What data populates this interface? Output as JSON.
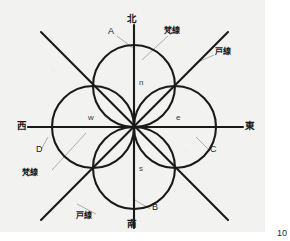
{
  "figure": {
    "background_color": "#f2f2f1",
    "stroke_color": "#1a1a1a",
    "leader_color": "#9a9a9a",
    "center": {
      "x": 134,
      "y": 127
    },
    "circle_radius": 41,
    "circles": [
      {
        "name": "north-circle",
        "cx": 134,
        "cy": 86
      },
      {
        "name": "east-circle",
        "cx": 175,
        "cy": 127
      },
      {
        "name": "south-circle",
        "cx": 134,
        "cy": 168
      },
      {
        "name": "west-circle",
        "cx": 93,
        "cy": 127
      }
    ],
    "axes": [
      {
        "name": "vertical-axis",
        "x1": 134,
        "y1": 25,
        "x2": 134,
        "y2": 228
      },
      {
        "name": "horizontal-axis",
        "x1": 28,
        "y1": 127,
        "x2": 243,
        "y2": 127
      },
      {
        "name": "diagonal-ne-sw",
        "x1": 41,
        "y1": 32,
        "x2": 228,
        "y2": 220
      },
      {
        "name": "diagonal-nw-se",
        "x1": 228,
        "y1": 32,
        "x2": 41,
        "y2": 220
      }
    ]
  },
  "labels": {
    "compass": {
      "north": "北",
      "east": "東",
      "south": "南",
      "west": "西"
    },
    "outer_points": {
      "a": "A",
      "b": "B",
      "c": "C",
      "d": "D"
    },
    "inner_points": {
      "n": "n",
      "e": "e",
      "s": "s",
      "w": "w"
    },
    "annotations": {
      "bonsen_top": "梵線",
      "bonsen_left": "梵線",
      "tosen_right": "戸線",
      "tosen_bottom": "戸線"
    }
  },
  "page": {
    "number": "10"
  }
}
